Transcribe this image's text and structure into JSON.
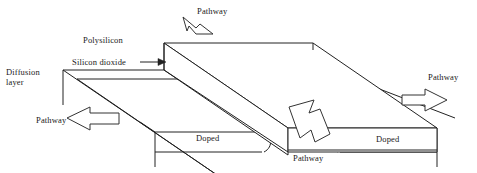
{
  "figure": {
    "kind": "mosfet-cross-section-schematic",
    "background_color": "#ffffff",
    "line_color": "#222222"
  },
  "labels": {
    "pathway_top": "Pathway",
    "polysilicon": "Polysilicon",
    "silicon_dioxide": "Silicon dioxide",
    "diffusion_layer_line1": "Diffusion",
    "diffusion_layer_line2": "layer",
    "pathway_left": "Pathway",
    "doped_left": "Doped",
    "pathway_bottom": "Pathway",
    "doped_right": "Doped",
    "pathway_right": "Pathway"
  },
  "annotations": {
    "leader_silicon_dioxide": "arrow-right-icon",
    "leader_pathway_top": "tapered-pointer-icon",
    "arrow_left": "block-arrow-left-icon",
    "arrow_center": "block-arrow-down-right-icon",
    "arrow_right": "block-arrow-right-icon"
  },
  "geometry": {
    "gate_top_face": "164,43 313,43 437,128 288,128",
    "gate_left_face": "164,43 164,70 288,155 288,128",
    "gate_front_face": "288,128 437,128 437,152 288,152",
    "oxide_top_face": "63,70 236,70 437,152 264,152",
    "diffusion_top_edge_left": "63,70 63,105",
    "doped_left_face": "155,132 264,132 264,152 155,152",
    "doped_right_face": "330,132 437,132 437,152 330,152"
  }
}
